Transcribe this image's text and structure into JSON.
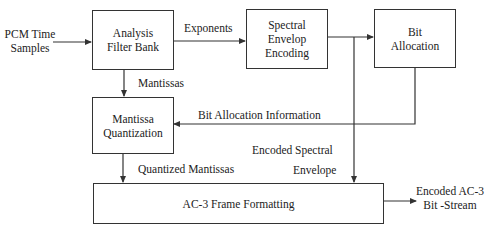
{
  "diagram": {
    "input": {
      "line1": "PCM Time",
      "line2": "Samples"
    },
    "blocks": {
      "analysis": {
        "line1": "Analysis",
        "line2": "Filter Bank"
      },
      "spectral": {
        "line1": "Spectral",
        "line2": "Envelop",
        "line3": "Encoding"
      },
      "bitalloc": {
        "line1": "Bit",
        "line2": "Allocation"
      },
      "mantissa": {
        "line1": "Mantissa",
        "line2": "Quantization"
      },
      "frame": {
        "label": "AC-3 Frame Formatting"
      }
    },
    "edges": {
      "exponents": "Exponents",
      "mantissas": "Mantissas",
      "bit_alloc_info": "Bit Allocation Information",
      "encoded_spectral_1": "Encoded Spectral",
      "encoded_spectral_2": "Envelope",
      "quantized_mantissas": "Quantized Mantissas"
    },
    "output": {
      "line1": "Encoded AC-3",
      "line2": "Bit -Stream"
    },
    "colors": {
      "line": "#333333",
      "background": "#ffffff",
      "text": "#222222"
    }
  }
}
